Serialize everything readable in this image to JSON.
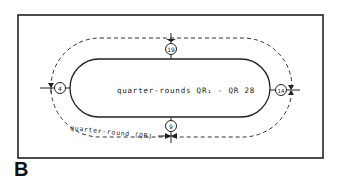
{
  "figure": {
    "label": "B",
    "center_text": "quarter-rounds QR₁ - QR 28",
    "path_label": "quarter-round (QR)",
    "markers": {
      "top": "19",
      "left": "4",
      "right": "14",
      "bottom": "9"
    }
  }
}
